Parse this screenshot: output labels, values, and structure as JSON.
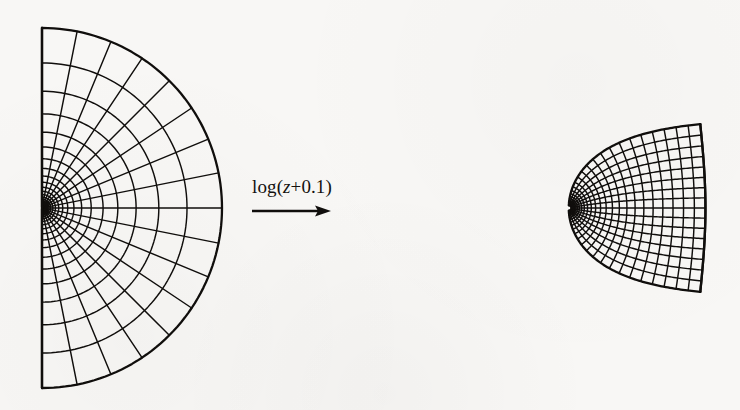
{
  "figure": {
    "caption_label": "log(z+0.1)",
    "label_parts": {
      "prefix": "log(",
      "variable": "z",
      "suffix": "+0.1)"
    },
    "arrow_icon": "right-arrow-icon",
    "background_color": "#f8f7f5",
    "ink_color": "#100e0c"
  },
  "chart_data": {
    "type": "line",
    "xlabel": "",
    "ylabel": "",
    "panels": [
      {
        "name": "source-domain",
        "description": "Half-disk polar grid with exponentially spaced radial arcs and uniformly spaced angular rays, singular point on the flat left edge",
        "center_px": [
          42,
          208
        ],
        "radius_px": 180,
        "angle_range_deg": [
          -90,
          90
        ],
        "n_rays": 17,
        "ray_step_deg": 11.25,
        "n_arcs": 26,
        "radius_min_frac": 0.0045,
        "radius_max_frac": 1.0,
        "radius_spacing": "geometric",
        "flat_edge": "vertical-left"
      },
      {
        "name": "image-domain",
        "description": "Image of the half-disk under w = log(z + 0.1); cusp at left, bulging right boundary",
        "cusp_px": [
          393,
          208
        ],
        "right_extent_px": 700,
        "top_corner_px": [
          690,
          52
        ],
        "bottom_corner_px": [
          688,
          365
        ],
        "offset_a": 0.1,
        "scale_px_per_unit": 57,
        "origin_px": [
          700,
          208
        ],
        "n_rays": 17,
        "n_arcs": 26
      }
    ],
    "transform": "w = log(z + 0.1)",
    "grid": "on",
    "legend": "none"
  }
}
